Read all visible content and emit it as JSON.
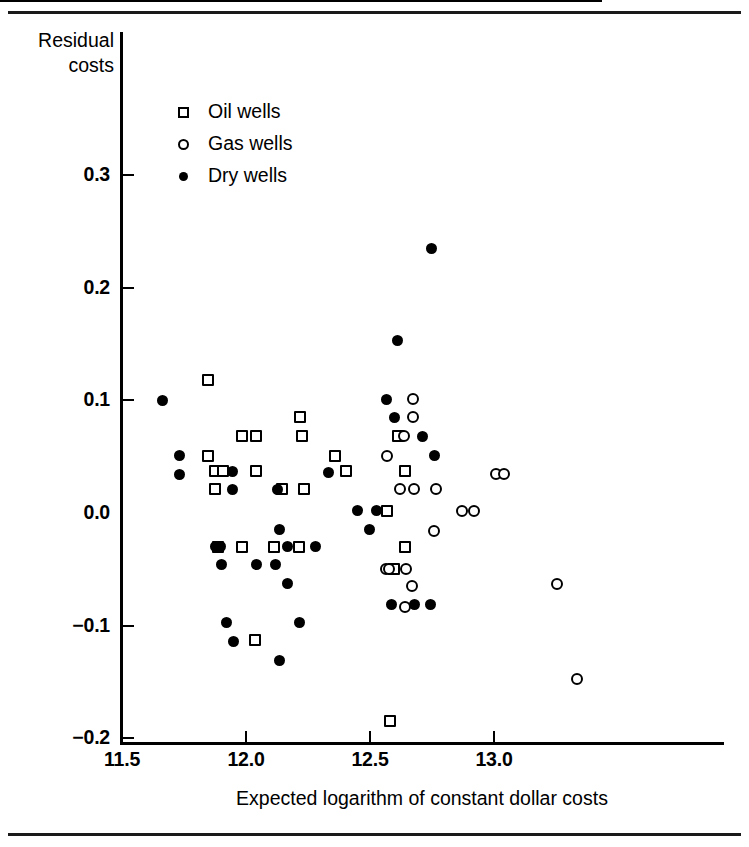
{
  "figure": {
    "has_top_rule": true,
    "has_bottom_rule": true
  },
  "chart_data": {
    "type": "scatter",
    "title": "",
    "subtitle": "",
    "xlabel": "Expected logarithm of constant dollar costs",
    "ylabel": "Residual costs",
    "ylabel_line1": "Residual",
    "ylabel_line2": "costs",
    "xlim": [
      11.42,
      13.82
    ],
    "ylim": [
      -0.2,
      0.355
    ],
    "grid": false,
    "legend_position": "top-left-inside",
    "xticks": [
      11.5,
      12.0,
      12.5,
      13.0
    ],
    "xtick_labels": [
      "11.5",
      "12.0",
      "12.5",
      "13.0"
    ],
    "yticks": [
      0.3,
      0.2,
      0.1,
      0.0,
      -0.1,
      -0.2
    ],
    "ytick_labels": [
      "0.3",
      "0.2",
      "0.1",
      "0.0",
      "−0.1",
      "−0.2"
    ],
    "zero_reference_line": 0.0,
    "marker_color": "#000000",
    "series": [
      {
        "name": "Oil wells",
        "marker": "open-square",
        "points": [
          [
            11.847,
            0.118
          ],
          [
            11.845,
            0.051
          ],
          [
            11.877,
            0.037
          ],
          [
            11.906,
            0.037
          ],
          [
            11.877,
            0.021
          ],
          [
            11.985,
            0.068
          ],
          [
            12.042,
            0.068
          ],
          [
            12.04,
            0.037
          ],
          [
            12.146,
            0.021
          ],
          [
            12.216,
            0.085
          ],
          [
            12.226,
            0.068
          ],
          [
            12.232,
            0.021
          ],
          [
            12.36,
            0.051
          ],
          [
            12.402,
            0.037
          ],
          [
            12.567,
            0.002
          ],
          [
            12.611,
            0.068
          ],
          [
            12.643,
            0.037
          ],
          [
            12.64,
            -0.03
          ],
          [
            12.597,
            -0.05
          ],
          [
            11.889,
            -0.03
          ],
          [
            11.982,
            -0.03
          ],
          [
            12.113,
            -0.03
          ],
          [
            12.213,
            -0.03
          ],
          [
            12.036,
            -0.113
          ],
          [
            12.58,
            -0.185
          ]
        ]
      },
      {
        "name": "Gas wells",
        "marker": "open-circle",
        "points": [
          [
            12.672,
            0.101
          ],
          [
            12.674,
            0.085
          ],
          [
            12.636,
            0.068
          ],
          [
            12.567,
            0.051
          ],
          [
            12.62,
            0.021
          ],
          [
            12.676,
            0.021
          ],
          [
            12.766,
            0.021
          ],
          [
            13.01,
            0.035
          ],
          [
            13.04,
            0.035
          ],
          [
            12.869,
            0.002
          ],
          [
            12.919,
            0.002
          ],
          [
            12.76,
            -0.016
          ],
          [
            12.563,
            -0.05
          ],
          [
            12.575,
            -0.05
          ],
          [
            12.644,
            -0.05
          ],
          [
            12.668,
            -0.065
          ],
          [
            12.64,
            -0.083
          ],
          [
            13.253,
            -0.063
          ],
          [
            13.336,
            -0.147
          ]
        ]
      },
      {
        "name": "Dry wells",
        "marker": "filled-circle",
        "points": [
          [
            11.664,
            0.1
          ],
          [
            11.731,
            0.051
          ],
          [
            11.731,
            0.034
          ],
          [
            11.945,
            0.037
          ],
          [
            11.945,
            0.021
          ],
          [
            12.128,
            0.021
          ],
          [
            12.333,
            0.036
          ],
          [
            12.567,
            0.101
          ],
          [
            12.6,
            0.085
          ],
          [
            12.61,
            0.153
          ],
          [
            12.71,
            0.068
          ],
          [
            12.747,
            0.235
          ],
          [
            12.76,
            0.051
          ],
          [
            12.449,
            0.002
          ],
          [
            12.527,
            0.002
          ],
          [
            11.876,
            -0.03
          ],
          [
            11.897,
            -0.03
          ],
          [
            12.166,
            -0.03
          ],
          [
            12.279,
            -0.03
          ],
          [
            11.903,
            -0.046
          ],
          [
            12.043,
            -0.046
          ],
          [
            12.119,
            -0.046
          ],
          [
            12.136,
            -0.015
          ],
          [
            12.168,
            -0.063
          ],
          [
            12.496,
            -0.015
          ],
          [
            12.585,
            -0.081
          ],
          [
            12.678,
            -0.081
          ],
          [
            12.744,
            -0.081
          ],
          [
            11.922,
            -0.097
          ],
          [
            12.217,
            -0.097
          ],
          [
            11.951,
            -0.114
          ],
          [
            12.137,
            -0.131
          ]
        ]
      }
    ]
  },
  "legend": {
    "items": [
      {
        "label": "Oil wells",
        "marker": "open-square",
        "icon": "square-outline-icon"
      },
      {
        "label": "Gas wells",
        "marker": "open-circle",
        "icon": "circle-outline-icon"
      },
      {
        "label": "Dry wells",
        "marker": "filled-circle",
        "icon": "circle-filled-icon"
      }
    ]
  }
}
